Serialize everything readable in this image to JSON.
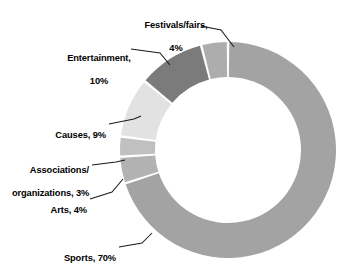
{
  "chart_data": {
    "type": "pie",
    "variant": "donut",
    "title": "",
    "subtitle": "",
    "xlabel": "",
    "ylabel": "",
    "legend_position": "none",
    "grid": false,
    "units": "percent",
    "start_angle_deg": 0,
    "direction": "clockwise",
    "total": 100,
    "categories": [
      "Sports",
      "Arts",
      "Associations/organizations",
      "Causes",
      "Entertainment",
      "Festivals/fairs"
    ],
    "values": [
      70,
      4,
      3,
      9,
      10,
      4
    ],
    "slices": [
      {
        "name": "Sports",
        "value": 70,
        "display": "70%",
        "color": "#a3a3a3",
        "label_line1": "Sports, 70%",
        "label_line2": ""
      },
      {
        "name": "Arts",
        "value": 4,
        "display": "4%",
        "color": "#b2b2b2",
        "label_line1": "Arts, 4%",
        "label_line2": ""
      },
      {
        "name": "Associations/organizations",
        "value": 3,
        "display": "3%",
        "color": "#c0c0c0",
        "label_line1": "Associations/",
        "label_line2": "organizations, 3%"
      },
      {
        "name": "Causes",
        "value": 9,
        "display": "9%",
        "color": "#e2e2e2",
        "label_line1": "Causes, 9%",
        "label_line2": ""
      },
      {
        "name": "Entertainment",
        "value": 10,
        "display": "10%",
        "color": "#7b7b7b",
        "label_line1": "Entertainment,",
        "label_line2": "10%"
      },
      {
        "name": "Festivals/fairs",
        "value": 4,
        "display": "4%",
        "color": "#adadad",
        "label_line1": "Festivals/fairs,",
        "label_line2": "4%"
      }
    ]
  },
  "labels": {
    "festivals_line1": "Festivals/fairs,",
    "festivals_line2": "4%",
    "entertainment_line1": "Entertainment,",
    "entertainment_line2": "10%",
    "causes": "Causes, 9%",
    "associations_line1": "Associations/",
    "associations_line2": "organizations, 3%",
    "arts": "Arts, 4%",
    "sports": "Sports, 70%"
  },
  "colors": {
    "background": "#ffffff",
    "text": "#000000",
    "leader_line": "#1a1a1a",
    "slice_gap": "#ffffff",
    "sports": "#a3a3a3",
    "arts": "#b2b2b2",
    "associations": "#c0c0c0",
    "causes": "#e2e2e2",
    "entertainment": "#7b7b7b",
    "festivals": "#adadad"
  }
}
